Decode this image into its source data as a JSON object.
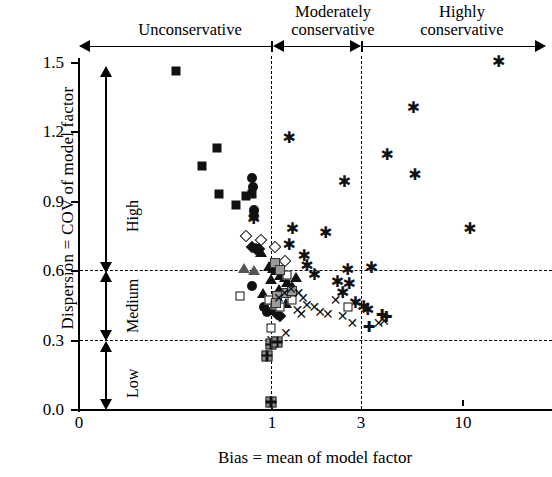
{
  "chart_data": {
    "type": "scatter",
    "title": "",
    "xlabel": "Bias = mean of model factor",
    "ylabel": "Dispersion = COV of model factor",
    "xscale": "log-like categorical",
    "xticks": [
      {
        "label": "0",
        "value": 0
      },
      {
        "label": "1",
        "value": 1
      },
      {
        "label": "3",
        "value": 3
      },
      {
        "label": "10",
        "value": 10
      }
    ],
    "yticks": [
      "0.0",
      "0.3",
      "0.6",
      "0.9",
      "1.2",
      "1.5"
    ],
    "ylim": [
      0.0,
      1.5
    ],
    "grid": "dashed horizontal at 0.3 and 0.6; dashed vertical at 1 and 3",
    "annotations": {
      "bands_top": [
        {
          "label": "Unconservative",
          "range": "0 to 1"
        },
        {
          "label": "Moderately\nconservative",
          "range": "1 to 3"
        },
        {
          "label": "Highly\nconservative",
          "range": "3 and above"
        }
      ],
      "bands_left": [
        {
          "label": "High",
          "range": "0.6 to 1.5"
        },
        {
          "label": "Medium",
          "range": "0.3 to 0.6"
        },
        {
          "label": "Low",
          "range": "0.0 to 0.3"
        }
      ]
    },
    "band_labels": {
      "unconservative": "Unconservative",
      "moderately_line1": "Moderately",
      "moderately_line2": "conservative",
      "highly_line1": "Highly",
      "highly_line2": "conservative",
      "high": "High",
      "medium": "Medium",
      "low": "Low"
    },
    "series": [
      {
        "name": "filled-square",
        "marker": "filled square",
        "points": [
          [
            0.2,
            1.46
          ],
          [
            0.35,
            1.05
          ],
          [
            0.46,
            1.13
          ],
          [
            0.47,
            0.93
          ],
          [
            0.62,
            0.88
          ],
          [
            0.72,
            0.92
          ],
          [
            0.78,
            0.93
          ],
          [
            0.8,
            0.84
          ]
        ]
      },
      {
        "name": "filled-circle",
        "marker": "filled circle",
        "points": [
          [
            0.78,
            1.0
          ],
          [
            0.79,
            0.96
          ],
          [
            0.8,
            0.86
          ],
          [
            0.78,
            0.53
          ],
          [
            0.92,
            0.44
          ],
          [
            0.95,
            0.42
          ]
        ]
      },
      {
        "name": "asterisk",
        "marker": "asterisk",
        "points": [
          [
            0.8,
            0.82
          ],
          [
            1.25,
            1.17
          ],
          [
            1.3,
            0.78
          ],
          [
            1.25,
            0.71
          ],
          [
            1.55,
            0.62
          ],
          [
            1.95,
            0.76
          ],
          [
            2.45,
            0.98
          ],
          [
            2.55,
            0.6
          ],
          [
            3.4,
            0.61
          ],
          [
            4.1,
            1.1
          ],
          [
            5.6,
            1.3
          ],
          [
            5.7,
            1.01
          ],
          [
            11.0,
            0.78
          ],
          [
            15.5,
            1.5
          ],
          [
            1.5,
            0.66
          ],
          [
            1.7,
            0.58
          ],
          [
            2.25,
            0.55
          ],
          [
            2.4,
            0.5
          ],
          [
            2.6,
            0.54
          ],
          [
            2.8,
            0.46
          ],
          [
            3.1,
            0.44
          ],
          [
            3.25,
            0.43
          ]
        ]
      },
      {
        "name": "open-diamond",
        "marker": "open diamond",
        "points": [
          [
            0.72,
            0.75
          ],
          [
            0.88,
            0.73
          ],
          [
            1.05,
            0.7
          ],
          [
            1.18,
            0.64
          ]
        ]
      },
      {
        "name": "filled-diamond",
        "marker": "filled diamond",
        "points": [
          [
            0.78,
            0.7
          ],
          [
            0.82,
            0.69
          ],
          [
            0.86,
            0.69
          ],
          [
            1.02,
            0.43
          ],
          [
            1.08,
            0.41
          ],
          [
            1.12,
            0.4
          ]
        ]
      },
      {
        "name": "filled-triangle",
        "marker": "filled triangle",
        "points": [
          [
            0.88,
            0.68
          ],
          [
            0.98,
            0.62
          ],
          [
            1.02,
            0.61
          ],
          [
            1.06,
            0.6
          ],
          [
            1.0,
            0.56
          ],
          [
            1.12,
            0.58
          ],
          [
            1.18,
            0.57
          ],
          [
            1.22,
            0.55
          ],
          [
            1.1,
            0.52
          ],
          [
            0.9,
            0.5
          ],
          [
            0.98,
            0.47
          ],
          [
            1.3,
            0.53
          ],
          [
            1.36,
            0.57
          ],
          [
            1.2,
            0.46
          ],
          [
            1.04,
            0.44
          ]
        ]
      },
      {
        "name": "open-triangle",
        "marker": "open triangle",
        "points": [
          [
            0.7,
            0.61
          ],
          [
            0.8,
            0.6
          ]
        ]
      },
      {
        "name": "open-square",
        "marker": "open square",
        "points": [
          [
            0.66,
            0.49
          ],
          [
            0.98,
            0.47
          ],
          [
            1.05,
            0.45
          ],
          [
            1.0,
            0.35
          ],
          [
            1.12,
            0.44
          ],
          [
            1.22,
            0.58
          ],
          [
            1.3,
            0.47
          ],
          [
            2.55,
            0.44
          ]
        ]
      },
      {
        "name": "gray-square",
        "marker": "gray filled square",
        "points": [
          [
            1.05,
            0.63
          ],
          [
            1.12,
            0.6
          ],
          [
            1.08,
            0.49
          ],
          [
            1.2,
            0.5
          ],
          [
            1.3,
            0.51
          ],
          [
            1.06,
            0.46
          ]
        ]
      },
      {
        "name": "x-mark",
        "marker": "x",
        "points": [
          [
            1.28,
            0.52
          ],
          [
            1.4,
            0.5
          ],
          [
            1.48,
            0.48
          ],
          [
            1.55,
            0.45
          ],
          [
            1.7,
            0.44
          ],
          [
            1.82,
            0.42
          ],
          [
            2.0,
            0.41
          ],
          [
            2.2,
            0.47
          ],
          [
            2.4,
            0.4
          ],
          [
            2.7,
            0.37
          ],
          [
            1.18,
            0.5
          ],
          [
            1.1,
            0.48
          ],
          [
            1.38,
            0.43
          ],
          [
            1.45,
            0.41
          ],
          [
            1.2,
            0.33
          ],
          [
            3.7,
            0.37
          ],
          [
            3.95,
            0.38
          ],
          [
            1.0,
            0.3
          ]
        ]
      },
      {
        "name": "plus",
        "marker": "plus",
        "points": [
          [
            3.3,
            0.36
          ],
          [
            3.85,
            0.41
          ],
          [
            4.05,
            0.4
          ]
        ]
      },
      {
        "name": "plus-in-square",
        "marker": "plus in gray square",
        "points": [
          [
            1.0,
            0.28
          ],
          [
            1.08,
            0.29
          ],
          [
            0.95,
            0.23
          ],
          [
            1.0,
            0.03
          ]
        ]
      }
    ]
  }
}
